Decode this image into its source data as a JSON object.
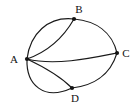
{
  "figure": {
    "width": 137,
    "height": 107,
    "background_color": "#ffffff",
    "stroke_color": "#1a1a1a",
    "label_color": "#111111"
  },
  "graph": {
    "vertices": [
      {
        "id": "A",
        "label": "A",
        "x": 27,
        "y": 59,
        "label_x": 14,
        "label_y": 63
      },
      {
        "id": "B",
        "label": "B",
        "x": 74,
        "y": 19,
        "label_x": 77,
        "label_y": 13
      },
      {
        "id": "C",
        "label": "C",
        "x": 117,
        "y": 53,
        "label_x": 122,
        "label_y": 57
      },
      {
        "id": "D",
        "label": "D",
        "x": 72,
        "y": 88,
        "label_x": 75,
        "label_y": 101
      }
    ],
    "edges": [
      {
        "id": "A-B-outer",
        "from": "A",
        "to": "B",
        "curve": "outer-upper"
      },
      {
        "id": "A-B-inner",
        "from": "A",
        "to": "B",
        "curve": "inner-lower"
      },
      {
        "id": "A-C",
        "from": "A",
        "to": "C",
        "curve": "slight-dip"
      },
      {
        "id": "B-C",
        "from": "B",
        "to": "C",
        "curve": "outer-right"
      },
      {
        "id": "A-D-outer",
        "from": "A",
        "to": "D",
        "curve": "outer-lower"
      },
      {
        "id": "A-D-inner",
        "from": "A",
        "to": "D",
        "curve": "inner-upper"
      },
      {
        "id": "D-C",
        "from": "D",
        "to": "C",
        "curve": "outer-lower-right"
      }
    ],
    "vertex_count": 4,
    "edge_count": 7,
    "degrees": {
      "A": 5,
      "B": 3,
      "C": 3,
      "D": 3
    }
  }
}
